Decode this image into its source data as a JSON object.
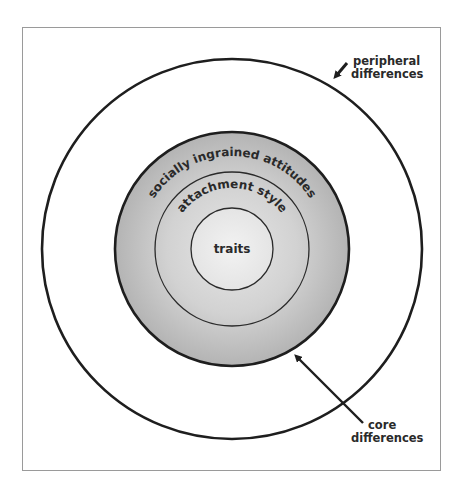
{
  "diagram": {
    "type": "concentric-circles",
    "layers": [
      {
        "id": "peripheral",
        "label": "peripheral differences",
        "kind": "outer-ring"
      },
      {
        "id": "core",
        "label": "socially ingrained attitudes",
        "kind": "core-ring"
      },
      {
        "id": "attachment",
        "label": "attachment style",
        "kind": "middle-ring"
      },
      {
        "id": "traits",
        "label": "traits",
        "kind": "center"
      }
    ],
    "callouts": {
      "peripheral": {
        "line1": "peripheral",
        "line2": "differences"
      },
      "core": {
        "line1": "core",
        "line2": "differences"
      }
    },
    "ring_labels": {
      "socially": "socially ingrained attitudes",
      "attachment": "attachment style",
      "traits": "traits"
    },
    "colors": {
      "frame_border": "#9a9a9a",
      "stroke": "#1e1e1e",
      "core_fill_outer": "#b9b9b9",
      "core_fill_inner": "#e0e0e0",
      "traits_fill": "#ececec",
      "text": "#2a2a2a"
    }
  }
}
